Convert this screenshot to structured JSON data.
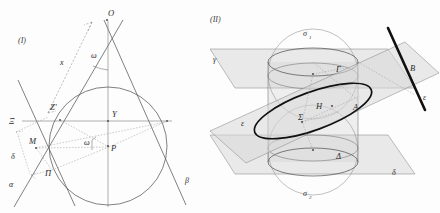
{
  "figure": {
    "title_absent": true,
    "panels": [
      {
        "id": "I",
        "number_label": "(I)",
        "type": "2d-construction",
        "description": "Circle inscribed in an angle with apex O, tangent lines alpha and beta, radius P, tangent point Z', axis through O, Y and P",
        "points": [
          {
            "name": "O",
            "label": "O",
            "x": 108,
            "y": 16
          },
          {
            "name": "Y",
            "label": "Y",
            "x": 112,
            "y": 117
          },
          {
            "name": "P",
            "label": "P",
            "x": 111,
            "y": 151
          },
          {
            "name": "M",
            "label": "M",
            "x": 35,
            "y": 144
          },
          {
            "name": "Zprime",
            "label": "Z'",
            "x": 55,
            "y": 110
          },
          {
            "name": "Xi",
            "label": "Ξ",
            "x": 13,
            "y": 121
          },
          {
            "name": "Pi",
            "label": "Π",
            "x": 48,
            "y": 174
          }
        ],
        "greek_labels": [
          {
            "name": "omega-apex",
            "label": "ω",
            "x": 94,
            "y": 56
          },
          {
            "name": "omega-center",
            "label": "ω",
            "x": 87,
            "y": 142
          },
          {
            "name": "alpha",
            "label": "α",
            "x": 12,
            "y": 184
          },
          {
            "name": "beta",
            "label": "β",
            "x": 188,
            "y": 180
          },
          {
            "name": "delta",
            "label": "δ",
            "x": 14,
            "y": 156
          },
          {
            "name": "x-segment",
            "label": "x",
            "x": 64,
            "y": 62
          }
        ]
      },
      {
        "id": "II",
        "number_label": "(II)",
        "type": "3d-construction",
        "description": "Cylinder with two inscribed Dandelin spheres sigma-1 and sigma-2, cutting plane epsilon producing an ellipse, horizontal planes gamma and delta, line B",
        "points": [
          {
            "name": "Gamma",
            "label": "Γ",
            "x": 336,
            "y": 70
          },
          {
            "name": "H",
            "label": "H",
            "x": 318,
            "y": 106
          },
          {
            "name": "Sigma",
            "label": "Σ",
            "x": 300,
            "y": 117
          },
          {
            "name": "A",
            "label": "A",
            "x": 354,
            "y": 107
          },
          {
            "name": "Delta",
            "label": "Δ",
            "x": 337,
            "y": 157
          },
          {
            "name": "B",
            "label": "B",
            "x": 412,
            "y": 68
          }
        ],
        "greek_labels": [
          {
            "name": "sigma-1",
            "label": "σ",
            "sub": "1",
            "x": 305,
            "y": 34
          },
          {
            "name": "sigma-2",
            "label": "σ",
            "sub": "2",
            "x": 305,
            "y": 194
          },
          {
            "name": "gamma",
            "label": "γ",
            "x": 215,
            "y": 59
          },
          {
            "name": "delta",
            "label": "δ",
            "x": 394,
            "y": 172
          },
          {
            "name": "epsilon-left",
            "label": "ε",
            "x": 243,
            "y": 123
          },
          {
            "name": "epsilon-right",
            "label": "ε",
            "x": 425,
            "y": 97
          }
        ]
      }
    ],
    "colors": {
      "background": "#fdfdfd",
      "ink": "#2b2b2b",
      "line": "#4a4a4a",
      "dashed": "#8a8a8a",
      "plane_fill": "#d9d9d9",
      "heavy": "#111111"
    }
  }
}
